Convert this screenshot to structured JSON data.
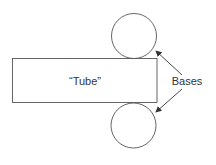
{
  "diagram": {
    "rectangle_label": "“Tube”",
    "bases_label": "Bases",
    "stroke_color": "#555555",
    "arrow_color": "#333333",
    "text_color": "#333333"
  }
}
